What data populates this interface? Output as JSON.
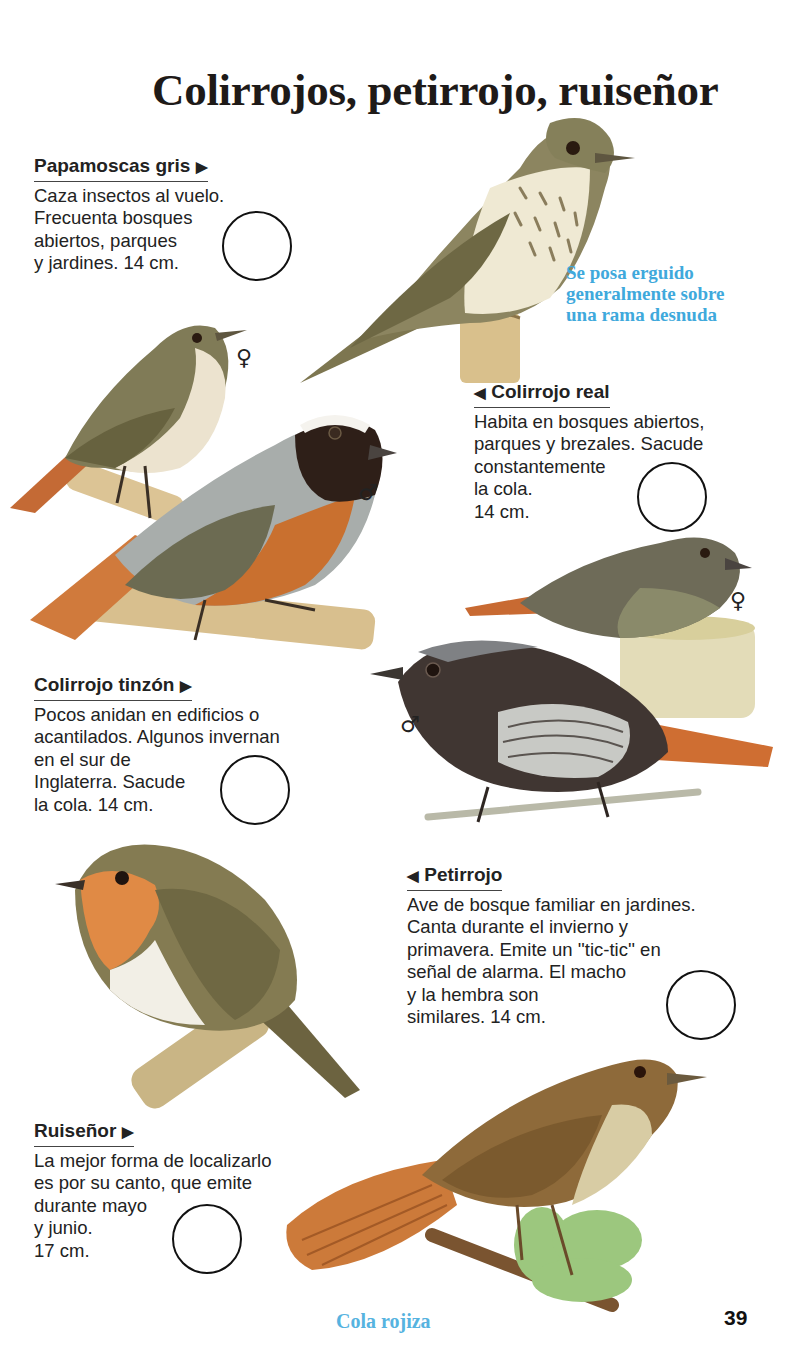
{
  "page": {
    "title": "Colirrojos, petirrojo, ruiseñor",
    "page_number": "39",
    "footer_caption": "Cola rojiza",
    "accent_color": "#3fa9dc"
  },
  "side_caption": "Se posa erguido\ngeneralmente sobre\nuna rama desnuda",
  "entries": [
    {
      "name": "Papamoscas gris",
      "arrow": "▶",
      "arrow_side": "right",
      "text": "Caza insectos al vuelo.\nFrecuenta bosques\nabiertos, parques\ny jardines. 14 cm."
    },
    {
      "name": "Colirrojo real",
      "arrow": "◀",
      "arrow_side": "left",
      "text": "Habita en bosques abiertos,\nparques y brezales. Sacude\nconstantemente\nla cola.\n14 cm."
    },
    {
      "name": "Colirrojo tinzón",
      "arrow": "▶",
      "arrow_side": "right",
      "text": "Pocos anidan en edificios o\nacantilados. Algunos invernan\nen el sur de\nInglaterra. Sacude\nla cola. 14 cm."
    },
    {
      "name": "Petirrojo",
      "arrow": "◀",
      "arrow_side": "left",
      "text": "Ave de bosque familiar en jardines.\nCanta durante el invierno y\nprimavera. Emite un ''tic-tic'' en\nseñal de alarma. El macho\ny la hembra son\nsimilares. 14 cm."
    },
    {
      "name": "Ruiseñor",
      "arrow": "▶",
      "arrow_side": "right",
      "text": "La mejor forma de localizarlo\nes por su canto, que emite\ndurante mayo\ny junio.\n17 cm."
    }
  ],
  "sex_symbols": {
    "female": "♀",
    "male": "♂"
  }
}
